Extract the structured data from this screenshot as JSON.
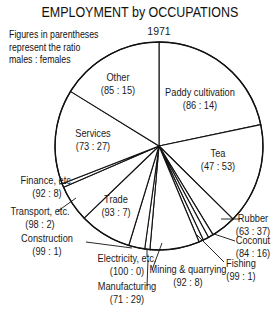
{
  "chart_data": {
    "type": "pie",
    "title": "EMPLOYMENT by OCCUPATIONS",
    "subtitle": "1971",
    "note": [
      "Figures in parentheses",
      "represent the ratio",
      "males : females"
    ],
    "start_angle_deg": 0,
    "direction": "clockwise",
    "slices": [
      {
        "name": "Paddy cultivation",
        "ratio": "86 : 14",
        "percent": 21.7
      },
      {
        "name": "Tea",
        "ratio": "47 : 53",
        "percent": 15.7
      },
      {
        "name": "Rubber",
        "ratio": "63 : 37",
        "percent": 3.9
      },
      {
        "name": "Coconut",
        "ratio": "84 : 16",
        "percent": 0.8
      },
      {
        "name": "Fishing",
        "ratio": "99 : 1",
        "percent": 0.9
      },
      {
        "name": "Mining & quarrying",
        "ratio": "92 : 8",
        "percent": 0.7
      },
      {
        "name": "Manufacturing",
        "ratio": "71 : 29",
        "percent": 7.7
      },
      {
        "name": "Electricity, etc.",
        "ratio": "100 : 0",
        "percent": 0.8
      },
      {
        "name": "Construction",
        "ratio": "99 : 1",
        "percent": 2.5
      },
      {
        "name": "Trade",
        "ratio": "93 : 7",
        "percent": 8.1
      },
      {
        "name": "Transport, etc.",
        "ratio": "98 : 2",
        "percent": 5.7
      },
      {
        "name": "Finance, etc.",
        "ratio": "92 : 8",
        "percent": 0.6
      },
      {
        "name": "Services",
        "ratio": "73 : 27",
        "percent": 14.7
      },
      {
        "name": "Other",
        "ratio": "85 : 15",
        "percent": 16.2
      }
    ]
  },
  "layout": {
    "cx": 159,
    "cy": 146,
    "r": 104
  },
  "labels": [
    {
      "slice": "Other",
      "lines": [
        "Other",
        "(85 : 15)"
      ],
      "x": 118,
      "y": 81,
      "anchor": "middle"
    },
    {
      "slice": "Paddy cultivation",
      "lines": [
        "Paddy cultivation",
        "(86 : 14)"
      ],
      "x": 200,
      "y": 96,
      "anchor": "middle"
    },
    {
      "slice": "Services",
      "lines": [
        "Services",
        "(73 : 27)"
      ],
      "x": 93,
      "y": 137,
      "anchor": "middle"
    },
    {
      "slice": "Tea",
      "lines": [
        "Tea",
        "(47 : 53)"
      ],
      "x": 218,
      "y": 157,
      "anchor": "middle"
    },
    {
      "slice": "Finance, etc.",
      "lines": [
        "Finance, etc.",
        "(92 : 8)"
      ],
      "x": 47,
      "y": 184,
      "anchor": "middle",
      "leader": [
        [
          59,
          184
        ],
        [
          66,
          183
        ]
      ]
    },
    {
      "slice": "Transport, etc.",
      "lines": [
        "Transport, etc.",
        "(98 : 2)"
      ],
      "x": 40,
      "y": 215,
      "anchor": "middle",
      "leader": [
        [
          58,
          211
        ],
        [
          76,
          198
        ]
      ]
    },
    {
      "slice": "Trade",
      "lines": [
        "Trade",
        "(93 : 7)"
      ],
      "x": 116,
      "y": 203,
      "anchor": "middle"
    },
    {
      "slice": "Construction",
      "lines": [
        "Construction",
        "(99 : 1)"
      ],
      "x": 47,
      "y": 242,
      "anchor": "middle",
      "leader": [
        [
          86,
          242
        ],
        [
          132,
          248
        ]
      ]
    },
    {
      "slice": "Electricity, etc.",
      "lines": [
        "Electricity, etc.",
        "(100 : 0)"
      ],
      "x": 127,
      "y": 262,
      "anchor": "middle",
      "leader": [
        [
          147,
          257
        ],
        [
          147,
          250
        ]
      ]
    },
    {
      "slice": "Manufacturing",
      "lines": [
        "Manufacturing",
        "(71 : 29)"
      ],
      "x": 127,
      "y": 290,
      "anchor": "middle",
      "leader": [
        [
          147,
          286
        ],
        [
          148,
          260
        ]
      ]
    },
    {
      "slice": "Mining & quarrying",
      "lines": [
        "Mining & quarrying",
        "(92 : 8)"
      ],
      "x": 188,
      "y": 273,
      "anchor": "middle",
      "leader": [
        [
          152,
          270
        ],
        [
          162,
          243
        ]
      ]
    },
    {
      "slice": "Rubber",
      "lines": [
        "Rubber",
        "(63 : 37)"
      ],
      "x": 253,
      "y": 222,
      "anchor": "middle",
      "leader": [
        [
          240,
          219
        ],
        [
          221,
          219
        ]
      ]
    },
    {
      "slice": "Coconut",
      "lines": [
        "Coconut",
        "(84 : 16)"
      ],
      "x": 253,
      "y": 244,
      "anchor": "middle",
      "leader": [
        [
          235,
          241
        ],
        [
          214,
          234
        ]
      ]
    },
    {
      "slice": "Fishing",
      "lines": [
        "Fishing",
        "(99 : 1)"
      ],
      "x": 241,
      "y": 267,
      "anchor": "middle",
      "leader": [
        [
          224,
          262
        ],
        [
          197,
          235
        ]
      ]
    }
  ]
}
